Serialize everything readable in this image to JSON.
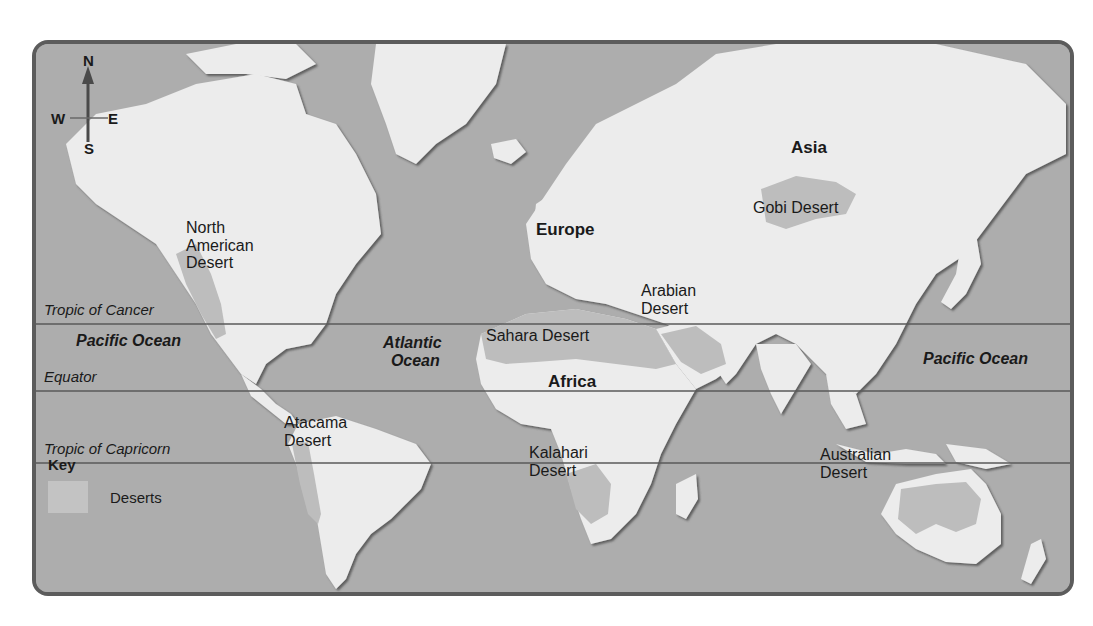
{
  "map": {
    "colors": {
      "ocean": "#adadad",
      "land": "#ececec",
      "desert": "#bdbdbd",
      "border": "#5c5c5c",
      "line": "#5a5a5a",
      "text": "#1a1a1a"
    },
    "compass": {
      "north": "N",
      "south": "S",
      "east": "E",
      "west": "W"
    },
    "latitude_lines": [
      {
        "name": "Tropic of Cancer",
        "y": 320
      },
      {
        "name": "Equator",
        "y": 387
      },
      {
        "name": "Tropic of Capricorn",
        "y": 459
      }
    ],
    "continents": {
      "asia": "Asia",
      "europe": "Europe",
      "africa": "Africa"
    },
    "oceans": {
      "pacific_west": "Pacific Ocean",
      "atlantic_line1": "Atlantic",
      "atlantic_line2": "Ocean",
      "pacific_east": "Pacific Ocean"
    },
    "deserts": {
      "north_american": {
        "line1": "North",
        "line2": "American",
        "line3": "Desert"
      },
      "atacama": {
        "line1": "Atacama",
        "line2": "Desert"
      },
      "sahara": "Sahara Desert",
      "arabian": {
        "line1": "Arabian",
        "line2": "Desert"
      },
      "gobi": "Gobi Desert",
      "kalahari": {
        "line1": "Kalahari",
        "line2": "Desert"
      },
      "australian": {
        "line1": "Australian",
        "line2": "Desert"
      }
    },
    "key": {
      "title": "Key",
      "items": [
        {
          "label": "Deserts",
          "swatch": "#c3c3c3"
        }
      ]
    }
  }
}
